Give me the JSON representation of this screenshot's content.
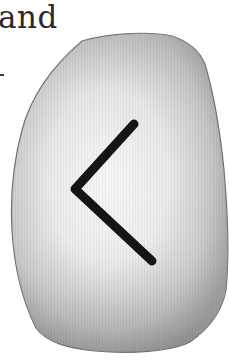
{
  "caption": {
    "text": "and"
  },
  "illustration": {
    "subject": "rune-stone",
    "rune_glyph": "kenaz",
    "rune_symbol": "ᚲ",
    "colors": {
      "stone_light": "#f4f4f4",
      "stone_mid": "#c9c9c9",
      "stone_dark": "#8e8e8e",
      "outline": "#6a6a6a",
      "rune": "#151515",
      "background": "#ffffff"
    }
  }
}
